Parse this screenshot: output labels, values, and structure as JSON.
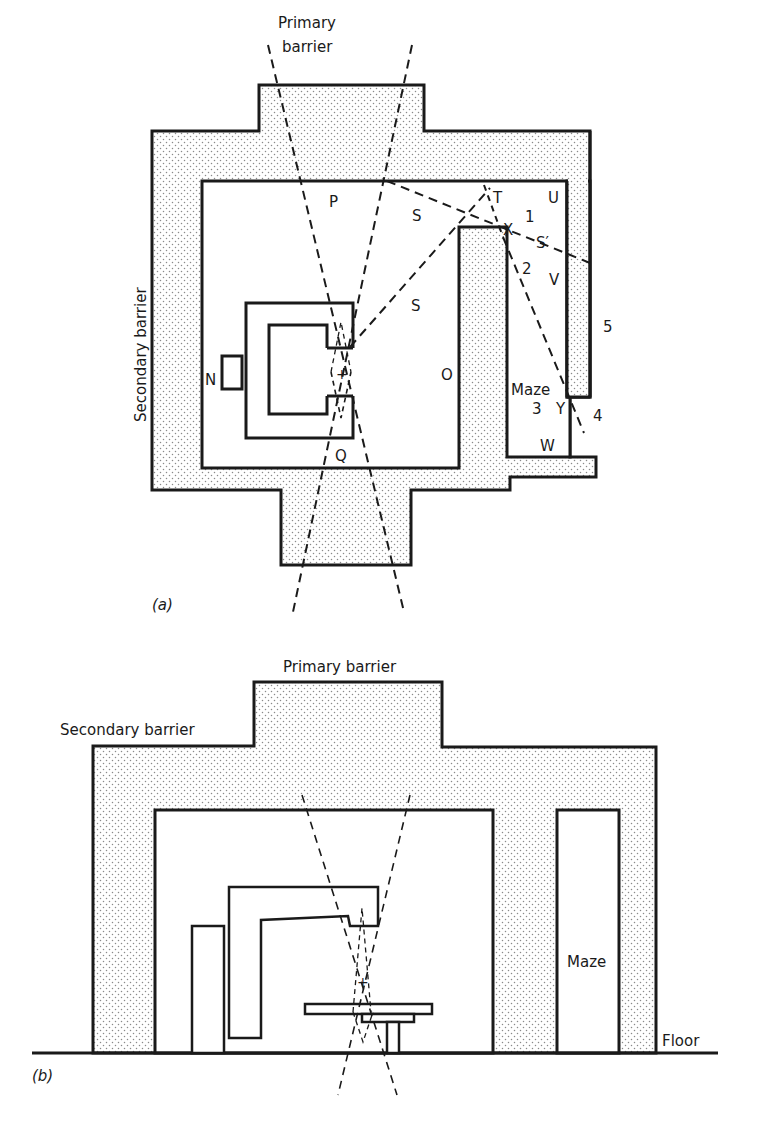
{
  "figure_a": {
    "panel_label": "(a)",
    "view": "plan",
    "labels": {
      "primary_barrier_line1": "Primary",
      "primary_barrier_line2": "barrier",
      "secondary_barrier": "Secondary barrier",
      "P": "P",
      "S_upper": "S",
      "S_lower": "S",
      "T": "T",
      "U": "U",
      "X": "X",
      "S_prime": "S′",
      "V": "V",
      "n1": "1",
      "n2": "2",
      "n3": "3",
      "n4": "4",
      "n5": "5",
      "N": "N",
      "O": "O",
      "Q": "Q",
      "maze": "Maze",
      "Y": "Y",
      "W": "W"
    }
  },
  "figure_b": {
    "panel_label": "(b)",
    "view": "elevation",
    "labels": {
      "primary_barrier": "Primary barrier",
      "secondary_barrier": "Secondary barrier",
      "maze": "Maze",
      "floor": "Floor"
    }
  },
  "colors": {
    "ink": "#1a1a1a",
    "background": "#ffffff",
    "hatch_dot": "#8a8a8a"
  }
}
